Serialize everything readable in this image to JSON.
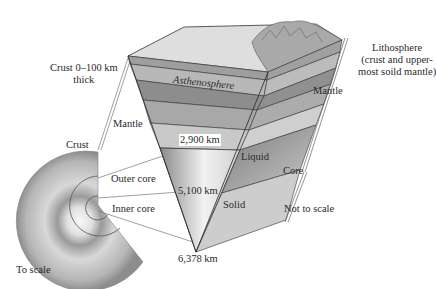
{
  "figure": {
    "labels": {
      "crust_thickness": "Crust 0–100 km\nthick",
      "crust_thickness_line1": "Crust 0–100 km",
      "crust_thickness_line2": "thick",
      "asthenosphere": "Asthenosphere",
      "lithosphere_line1": "Lithosphere",
      "lithosphere_line2": "(crust and upper-",
      "lithosphere_line3": "most soild mantle)",
      "mantle_right": "Mantle",
      "mantle_left": "Mantle",
      "crust_left": "Crust",
      "depth_2900": "2,900 km",
      "depth_5100": "5,100 km",
      "depth_6378": "6,378 km",
      "liquid": "Liquid",
      "solid": "Solid",
      "core": "Core",
      "outer_core": "Outer core",
      "inner_core": "Inner core",
      "not_to_scale": "Not to scale",
      "to_scale": "To scale"
    },
    "colors": {
      "surface_top": "#d9d9d9",
      "crust": "#9a9a9a",
      "asthenosphere": "#8c8c8c",
      "mantle_light": "#c8c8c8",
      "mantle_mid": "#b0b0b0",
      "outer_core": "#7a7a7a",
      "inner_core": "#bdbdbd",
      "outline": "#333333"
    }
  }
}
